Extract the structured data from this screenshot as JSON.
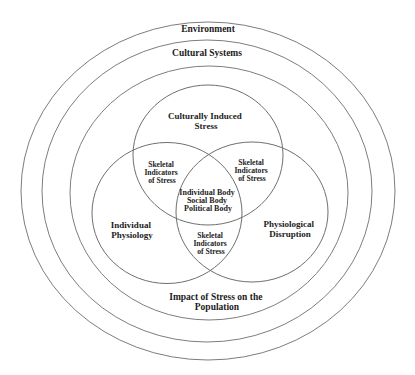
{
  "diagram": {
    "colors": {
      "background": "#ffffff",
      "ring_stroke": "#7d7d7d",
      "venn_stroke": "#6f6f6f",
      "text": "#1c1c1c"
    },
    "layers": {
      "environment": {
        "label": "Environment"
      },
      "cultural_systems": {
        "label": "Cultural Systems"
      },
      "population_impact": {
        "lines": [
          "Impact of Stress on the",
          "Population"
        ]
      }
    },
    "venn": {
      "top": {
        "lines": [
          "Culturally Induced",
          "Stress"
        ]
      },
      "left": {
        "lines": [
          "Individual",
          "Physiology"
        ]
      },
      "right": {
        "lines": [
          "Physiological",
          "Disruption"
        ]
      },
      "overlap_top_left": {
        "lines": [
          "Skeletal",
          "Indicators",
          "of Stress"
        ]
      },
      "overlap_top_right": {
        "lines": [
          "Skeletal",
          "Indicators",
          "of Stress"
        ]
      },
      "overlap_bottom": {
        "lines": [
          "Skeletal",
          "Indicators",
          "of Stress"
        ]
      },
      "center": {
        "lines": [
          "Individual Body",
          "Social Body",
          "Political Body"
        ]
      }
    }
  }
}
